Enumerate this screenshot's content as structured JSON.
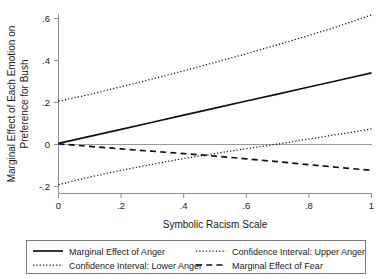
{
  "chart_data": {
    "type": "line",
    "title": "",
    "xlabel": "Symbolic Racism Scale",
    "ylabel": "Marginal Effect of Each Emotion on Preference for Bush",
    "xlim": [
      0,
      1
    ],
    "ylim": [
      -0.2,
      0.6
    ],
    "xticks": [
      "0",
      ".2",
      ".4",
      ".6",
      ".8",
      "1"
    ],
    "xtick_values": [
      0,
      0.2,
      0.4,
      0.6,
      0.8,
      1
    ],
    "yticks": [
      "-.2",
      "0",
      ".2",
      ".4",
      ".6"
    ],
    "ytick_values": [
      -0.2,
      0,
      0.2,
      0.4,
      0.6
    ],
    "grid": false,
    "legend_position": "bottom",
    "zero_reference_line": true,
    "x": [
      0,
      0.1,
      0.2,
      0.3,
      0.4,
      0.5,
      0.6,
      0.7,
      0.8,
      0.9,
      1
    ],
    "series": [
      {
        "name": "Marginal Effect of Anger",
        "style": "solid",
        "values": [
          0.005,
          0.039,
          0.072,
          0.106,
          0.14,
          0.173,
          0.207,
          0.24,
          0.274,
          0.307,
          0.341
        ]
      },
      {
        "name": "Confidence Interval: Upper Anger",
        "style": "dotted",
        "values": [
          0.205,
          0.239,
          0.275,
          0.312,
          0.351,
          0.391,
          0.432,
          0.475,
          0.519,
          0.566,
          0.617
        ]
      },
      {
        "name": "Confidence Interval: Lower Anger",
        "style": "dotted",
        "values": [
          -0.191,
          -0.155,
          -0.123,
          -0.094,
          -0.067,
          -0.043,
          -0.02,
          0.002,
          0.026,
          0.05,
          0.074
        ]
      },
      {
        "name": "Marginal Effect of Fear",
        "style": "dashed",
        "values": [
          0.003,
          -0.009,
          -0.021,
          -0.032,
          -0.043,
          -0.055,
          -0.068,
          -0.082,
          -0.096,
          -0.11,
          -0.123
        ]
      }
    ]
  },
  "axes": {
    "x_title": "Symbolic Racism Scale",
    "y_title_line1": "Marginal Effect of Each Emotion on",
    "y_title_line2": "Preference for Bush",
    "x_tick_labels": [
      "0",
      ".2",
      ".4",
      ".6",
      ".8",
      "1"
    ],
    "y_tick_labels": [
      ".6",
      ".4",
      ".2",
      "0",
      "-.2"
    ]
  },
  "legend": {
    "items": [
      {
        "label": "Marginal Effect of Anger",
        "style": "solid"
      },
      {
        "label": "Confidence Interval: Upper Anger",
        "style": "dotted"
      },
      {
        "label": "Confidence Interval: Lower Anger",
        "style": "dotted"
      },
      {
        "label": "Marginal Effect of Fear",
        "style": "dashed"
      }
    ]
  },
  "colors": {
    "line": "#111111",
    "axis": "#8f8f8f",
    "background": "#ffffff"
  }
}
